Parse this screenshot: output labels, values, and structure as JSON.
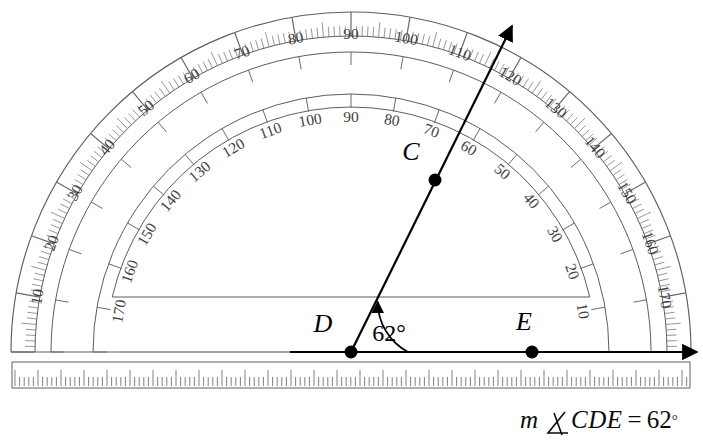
{
  "figure": {
    "kind": "protractor-angle-diagram",
    "caption": {
      "m": "m",
      "angle_symbol": "angle-symbol",
      "label": "CDE",
      "equals": "=",
      "value": "62",
      "degree": "°",
      "full_text": "m ∡CDE = 62°"
    },
    "angle": {
      "measure": 62,
      "unit": "degrees",
      "arc_label": "62°",
      "vertex": "D",
      "ray_points": [
        "C",
        "E"
      ]
    },
    "points": [
      {
        "name": "C",
        "label": "C",
        "x": 435,
        "y": 180,
        "label_x": 411,
        "label_y": 160
      },
      {
        "name": "D",
        "label": "D",
        "x": 351,
        "y": 352,
        "label_x": 323,
        "label_y": 332
      },
      {
        "name": "E",
        "label": "E",
        "x": 532,
        "y": 352,
        "label_x": 524,
        "label_y": 330
      }
    ],
    "protractor": {
      "center_x": 351,
      "center_y": 352,
      "outer_radius": 340,
      "tick_ring_radius": 316,
      "outer_scale_radius": 300,
      "inner_scale_radius": 258,
      "cutout_radius": 245,
      "cutout_flat_y": 297,
      "left_edge_x": 12,
      "right_edge_x": 690,
      "top_y": 8,
      "baseline_y": 352,
      "outer_scale_labels": [
        10,
        20,
        30,
        40,
        50,
        60,
        70,
        80,
        90,
        100,
        110,
        120,
        130,
        140,
        150,
        160,
        170
      ],
      "inner_scale_labels": [
        170,
        160,
        150,
        140,
        130,
        120,
        110,
        100,
        90,
        80,
        70,
        60,
        50,
        40,
        30,
        20,
        10
      ],
      "outer_scale_direction": "right-to-left",
      "inner_scale_direction": "left-to-right",
      "minor_tick_step": 1,
      "major_tick_step": 10
    },
    "ruler": {
      "top_y": 362,
      "bottom_y": 388,
      "left_x": 12,
      "right_x": 690,
      "tick_spacing": 4.6,
      "label": "ruler-edge"
    },
    "rays": {
      "horizontal": {
        "from_x": 290,
        "to_x": 697,
        "y": 352,
        "arrow": "right"
      },
      "slanted": {
        "from_x": 351,
        "from_y": 352,
        "to_x": 512,
        "to_y": 26,
        "arrow": "up-right",
        "angle_deg": 62
      }
    },
    "colors": {
      "ink": "#000000",
      "scale_line": "#5d5d5d",
      "tick": "#6a6a6a",
      "background": "#ffffff"
    }
  }
}
